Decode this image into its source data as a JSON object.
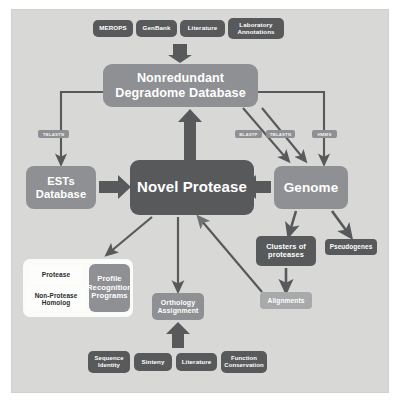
{
  "diagram": {
    "colors": {
      "panel_background": "#d8d9d6",
      "dark_node": "#58595b",
      "mid_node": "#8e9093",
      "light_node": "#a7a9ab",
      "white_node": "#fdfdfb",
      "arrow": "#58595b",
      "text_light": "#ffffff",
      "text_dark": "#2b2b2b"
    },
    "sources": [
      {
        "id": "merops",
        "label": "MEROPS"
      },
      {
        "id": "genbank",
        "label": "GenBank"
      },
      {
        "id": "literature_top",
        "label": "Literature"
      },
      {
        "id": "laboratory_annotations",
        "label": "Laboratory Annotations"
      }
    ],
    "nodes": {
      "nonredundant_db": "Nonredundant Degradome Database",
      "ests_database": "ESTs Database",
      "novel_protease": "Novel Protease",
      "genome": "Genome",
      "clusters_of_proteases": "Clusters of proteases",
      "pseudogenes": "Pseudogenes",
      "alignments": "Alignments",
      "orthology_assignment": "Orthology Assignment",
      "protease": "Protease",
      "non_protease_homolog": "Non-Protease Homolog",
      "profile_recognition_programs": "Profile Recognition Programs"
    },
    "edge_labels": {
      "tblastn_to_ests": "TBLASTN",
      "blastp_to_genome": "BLASTP",
      "tblastn_to_genome": "TBLASTN",
      "hmms_to_genome": "HMMS"
    },
    "evidence": [
      {
        "id": "sequence_identity",
        "label": "Sequence Identity"
      },
      {
        "id": "sinteny",
        "label": "Sinteny"
      },
      {
        "id": "literature_bottom",
        "label": "Literature"
      },
      {
        "id": "function_conservation",
        "label": "Function Conservation"
      }
    ]
  }
}
